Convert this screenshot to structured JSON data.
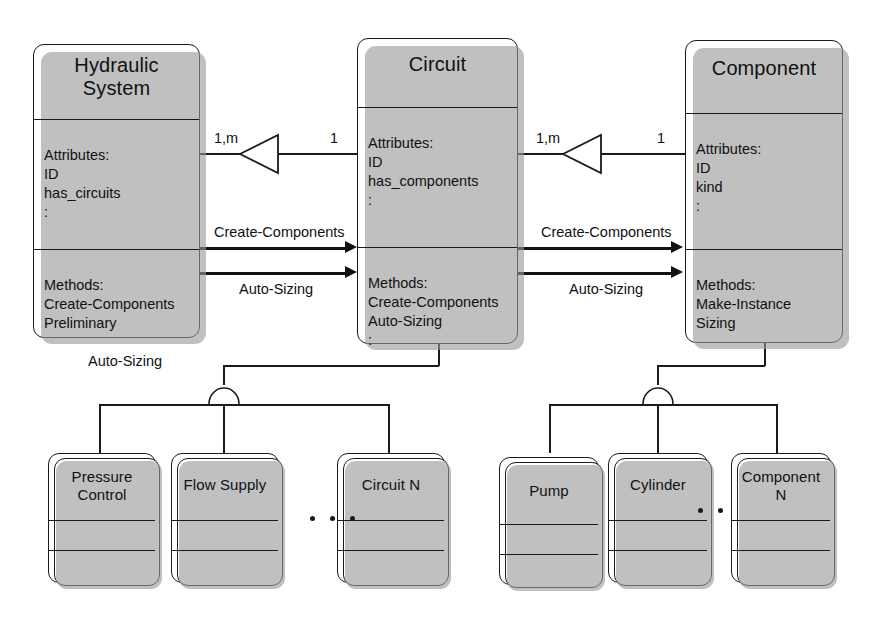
{
  "diagram": {
    "type": "omt-class-diagram",
    "colors": {
      "line": "#1a1a1a",
      "box_fill": "#ffffff",
      "shadow": "#9a9a9a"
    }
  },
  "classes": [
    {
      "id": "hydraulic-system",
      "name": "Hydraulic\nSystem",
      "attributes_header": "Attributes:",
      "attributes": "ID\nhas_circuits\n:",
      "methods_header": "Methods:",
      "methods": "Create-Components\nPreliminary",
      "methods_hanging": "Auto-Sizing"
    },
    {
      "id": "circuit",
      "name": "Circuit",
      "attributes_header": "Attributes:",
      "attributes": "ID\nhas_components\n:",
      "methods_header": "Methods:",
      "methods": "Create-Components\nAuto-Sizing\n:"
    },
    {
      "id": "component",
      "name": "Component",
      "attributes_header": "Attributes:",
      "attributes": "ID\nkind\n:",
      "methods_header": "Methods:",
      "methods": "Make-Instance\nSizing"
    }
  ],
  "associations": [
    {
      "id": "hydraulic-to-circuit",
      "source_multiplicity": "1,m",
      "target_multiplicity": "1",
      "messages": [
        {
          "label": "Create-Components"
        },
        {
          "label": "Auto-Sizing"
        }
      ]
    },
    {
      "id": "circuit-to-component",
      "source_multiplicity": "1,m",
      "target_multiplicity": "1",
      "messages": [
        {
          "label": "Create-Components"
        },
        {
          "label": "Auto-Sizing"
        }
      ]
    }
  ],
  "subclasses": {
    "circuit_children": [
      {
        "id": "pressure-control",
        "name": "Pressure\nControl"
      },
      {
        "id": "flow-supply",
        "name": "Flow Supply"
      },
      {
        "id": "circuit-n",
        "name": "Circuit N"
      }
    ],
    "component_children": [
      {
        "id": "pump",
        "name": "Pump"
      },
      {
        "id": "cylinder",
        "name": "Cylinder"
      },
      {
        "id": "component-n",
        "name": "Component\nN"
      }
    ],
    "ellipsis_left": "• • •",
    "ellipsis_right": "• •"
  }
}
